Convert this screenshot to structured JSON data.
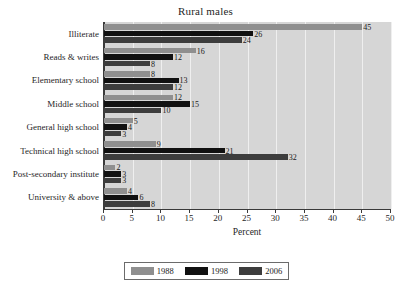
{
  "chart_data": {
    "type": "bar",
    "orientation": "horizontal",
    "title": "Rural males",
    "xlabel": "Percent",
    "ylabel": "",
    "xlim": [
      0,
      50
    ],
    "xticks": [
      0,
      5,
      10,
      15,
      20,
      25,
      30,
      35,
      40,
      45,
      50
    ],
    "grid": true,
    "legend_position": "bottom",
    "categories": [
      "Illiterate",
      "Reads & writes",
      "Elementary school",
      "Middle school",
      "General high school",
      "Technical high school",
      "Post-secondary institute",
      "University & above"
    ],
    "series": [
      {
        "name": "1988",
        "color": "#8f8f8f",
        "values": [
          45,
          16,
          8,
          12,
          5,
          9,
          2,
          4
        ]
      },
      {
        "name": "1998",
        "color": "#111111",
        "values": [
          26,
          12,
          13,
          15,
          4,
          21,
          3,
          6
        ]
      },
      {
        "name": "2006",
        "color": "#3d3d3d",
        "values": [
          24,
          8,
          12,
          10,
          3,
          32,
          3,
          8
        ]
      }
    ]
  },
  "legend": {
    "items": [
      {
        "label": "1988",
        "swatch": "s1988"
      },
      {
        "label": "1998",
        "swatch": "s1998"
      },
      {
        "label": "2006",
        "swatch": "s2006"
      }
    ]
  },
  "colors": {
    "plot_background": "#d6d6d6",
    "gridline": "#efefef",
    "axis": "#3a3a3a",
    "series_1988": "#8f8f8f",
    "series_1998": "#111111",
    "series_2006": "#3d3d3d"
  }
}
